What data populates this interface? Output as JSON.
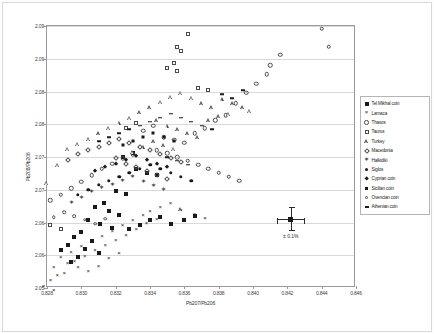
{
  "chart_data": {
    "type": "scatter",
    "title": "",
    "xlabel": "Pb207/Pb206",
    "ylabel": "Pb208/Pb206",
    "xlim": [
      0.828,
      0.846
    ],
    "ylim": [
      2.05,
      2.09
    ],
    "xticks": [
      "0.828",
      "0.830",
      "0.832",
      "0.834",
      "0.836",
      "0.838",
      "0.840",
      "0.842",
      "0.844",
      "0.846"
    ],
    "yticks": [
      "2.05",
      "2.06",
      "2.06",
      "2.07",
      "2.07",
      "2.08",
      "2.08",
      "2.09",
      "2.09"
    ],
    "ytick_values": [
      2.05,
      2.055,
      2.06,
      2.065,
      2.07,
      2.075,
      2.08,
      2.085,
      2.09
    ],
    "grid": "horizontal",
    "legend_position": "right",
    "annotation": {
      "label": "± 0.1%",
      "x": 0.8422,
      "y": 2.0605
    },
    "series": [
      {
        "name": "Tel Mikhal coin",
        "marker": "filled-square",
        "points": [
          [
            0.8332,
            2.0682
          ],
          [
            0.8338,
            2.0676
          ],
          [
            0.8344,
            2.0672
          ],
          [
            0.832,
            2.0648
          ],
          [
            0.8326,
            2.0644
          ],
          [
            0.8313,
            2.063
          ],
          [
            0.8308,
            2.0624
          ],
          [
            0.8316,
            2.0618
          ],
          [
            0.8322,
            2.0612
          ],
          [
            0.8304,
            2.0604
          ],
          [
            0.8311,
            2.0598
          ],
          [
            0.8318,
            2.0592
          ],
          [
            0.83,
            2.0586
          ],
          [
            0.8328,
            2.059
          ],
          [
            0.8334,
            2.0596
          ],
          [
            0.8296,
            2.0578
          ],
          [
            0.8306,
            2.0572
          ],
          [
            0.834,
            2.0604
          ],
          [
            0.8346,
            2.0608
          ],
          [
            0.8352,
            2.0598
          ],
          [
            0.8292,
            2.0566
          ],
          [
            0.8302,
            2.056
          ],
          [
            0.831,
            2.0554
          ],
          [
            0.8298,
            2.0548
          ],
          [
            0.8288,
            2.0558
          ],
          [
            0.8294,
            2.054
          ],
          [
            0.836,
            2.0604
          ],
          [
            0.8366,
            2.061
          ],
          [
            0.8324,
            2.07
          ],
          [
            0.833,
            2.0706
          ]
        ]
      },
      {
        "name": "Larnaca",
        "marker": "x-cross",
        "points": [
          [
            0.8284,
            2.053
          ],
          [
            0.829,
            2.0522
          ],
          [
            0.8296,
            2.054
          ],
          [
            0.8302,
            2.0548
          ],
          [
            0.8308,
            2.0556
          ],
          [
            0.8314,
            2.0564
          ],
          [
            0.832,
            2.0572
          ],
          [
            0.8326,
            2.058
          ],
          [
            0.8332,
            2.0588
          ],
          [
            0.8288,
            2.0546
          ],
          [
            0.8294,
            2.0554
          ],
          [
            0.83,
            2.0562
          ],
          [
            0.8306,
            2.057
          ],
          [
            0.8312,
            2.0578
          ],
          [
            0.8318,
            2.0586
          ],
          [
            0.8324,
            2.0594
          ],
          [
            0.833,
            2.0602
          ],
          [
            0.8336,
            2.061
          ],
          [
            0.8292,
            2.0536
          ],
          [
            0.8298,
            2.053
          ],
          [
            0.8286,
            2.0518
          ],
          [
            0.8282,
            2.051
          ],
          [
            0.8304,
            2.0524
          ],
          [
            0.831,
            2.0532
          ],
          [
            0.8316,
            2.0544
          ],
          [
            0.8322,
            2.0552
          ],
          [
            0.834,
            2.0616
          ],
          [
            0.8346,
            2.0622
          ],
          [
            0.8352,
            2.0628
          ],
          [
            0.8358,
            2.0618
          ],
          [
            0.8366,
            2.0612
          ],
          [
            0.8372,
            2.0606
          ],
          [
            0.8278,
            2.0502
          ],
          [
            0.8284,
            2.0496
          ],
          [
            0.8338,
            2.0598
          ],
          [
            0.8344,
            2.0604
          ]
        ]
      },
      {
        "name": "Thasos",
        "marker": "open-circle",
        "points": [
          [
            0.8336,
            2.074
          ],
          [
            0.8342,
            2.0748
          ],
          [
            0.8348,
            2.073
          ],
          [
            0.8354,
            2.0726
          ],
          [
            0.836,
            2.0722
          ],
          [
            0.8366,
            2.0736
          ],
          [
            0.8372,
            2.0744
          ],
          [
            0.8378,
            2.0756
          ],
          [
            0.8384,
            2.0764
          ],
          [
            0.839,
            2.0782
          ],
          [
            0.8396,
            2.0798
          ],
          [
            0.8402,
            2.0812
          ],
          [
            0.8408,
            2.0826
          ],
          [
            0.844,
            2.0896
          ],
          [
            0.8444,
            2.0868
          ],
          [
            0.833,
            2.0704
          ],
          [
            0.8324,
            2.0698
          ],
          [
            0.8318,
            2.069
          ],
          [
            0.8312,
            2.0682
          ],
          [
            0.8306,
            2.0672
          ],
          [
            0.83,
            2.0662
          ],
          [
            0.8294,
            2.0652
          ],
          [
            0.8344,
            2.071
          ],
          [
            0.835,
            2.0706
          ],
          [
            0.8356,
            2.07
          ],
          [
            0.8362,
            2.0694
          ],
          [
            0.8368,
            2.0688
          ],
          [
            0.8374,
            2.0682
          ],
          [
            0.841,
            2.084
          ],
          [
            0.8416,
            2.0856
          ],
          [
            0.8288,
            2.0642
          ],
          [
            0.8282,
            2.0634
          ],
          [
            0.838,
            2.0676
          ],
          [
            0.8386,
            2.067
          ],
          [
            0.8392,
            2.0664
          ]
        ]
      },
      {
        "name": "Taurus",
        "marker": "open-square",
        "points": [
          [
            0.8362,
            2.0888
          ],
          [
            0.8356,
            2.0868
          ],
          [
            0.8358,
            2.0862
          ],
          [
            0.8354,
            2.0844
          ],
          [
            0.835,
            2.0836
          ],
          [
            0.8356,
            2.0832
          ],
          [
            0.8282,
            2.0596
          ],
          [
            0.8288,
            2.059
          ],
          [
            0.8326,
            2.0744
          ],
          [
            0.8332,
            2.0752
          ],
          [
            0.8368,
            2.0806
          ],
          [
            0.8374,
            2.0802
          ]
        ]
      },
      {
        "name": "Turkey",
        "marker": "open-triangle",
        "points": [
          [
            0.8346,
            2.0784
          ],
          [
            0.8352,
            2.0792
          ],
          [
            0.8358,
            2.0798
          ],
          [
            0.8364,
            2.079
          ],
          [
            0.837,
            2.0782
          ],
          [
            0.8376,
            2.0776
          ],
          [
            0.8382,
            2.0788
          ],
          [
            0.8388,
            2.0782
          ],
          [
            0.8394,
            2.0776
          ],
          [
            0.834,
            2.0776
          ],
          [
            0.8334,
            2.0768
          ],
          [
            0.8328,
            2.076
          ],
          [
            0.8322,
            2.0752
          ],
          [
            0.8316,
            2.0744
          ],
          [
            0.831,
            2.0736
          ],
          [
            0.8304,
            2.0728
          ],
          [
            0.8298,
            2.072
          ],
          [
            0.8292,
            2.0712
          ],
          [
            0.8286,
            2.0688
          ],
          [
            0.828,
            2.066
          ],
          [
            0.8344,
            2.0756
          ],
          [
            0.835,
            2.0748
          ],
          [
            0.8356,
            2.0742
          ],
          [
            0.8362,
            2.0736
          ],
          [
            0.8368,
            2.073
          ],
          [
            0.8374,
            2.0756
          ],
          [
            0.838,
            2.0762
          ],
          [
            0.8386,
            2.0766
          ],
          [
            0.8398,
            2.077
          ],
          [
            0.8342,
            2.0724
          ],
          [
            0.8348,
            2.0718
          ],
          [
            0.8354,
            2.0712
          ],
          [
            0.8336,
            2.0716
          ],
          [
            0.833,
            2.0708
          ],
          [
            0.8358,
            2.062
          ]
        ]
      },
      {
        "name": "Macedonia",
        "marker": "open-diamond",
        "points": [
          [
            0.831,
            2.0716
          ],
          [
            0.8316,
            2.0722
          ],
          [
            0.8322,
            2.0728
          ],
          [
            0.8328,
            2.0722
          ],
          [
            0.8334,
            2.0716
          ],
          [
            0.834,
            2.071
          ],
          [
            0.8346,
            2.0704
          ],
          [
            0.8352,
            2.0698
          ],
          [
            0.8358,
            2.0692
          ],
          [
            0.8304,
            2.071
          ],
          [
            0.8298,
            2.0704
          ],
          [
            0.8292,
            2.0696
          ],
          [
            0.8326,
            2.069
          ],
          [
            0.8332,
            2.0684
          ],
          [
            0.8338,
            2.0678
          ],
          [
            0.8344,
            2.0672
          ],
          [
            0.835,
            2.0666
          ],
          [
            0.832,
            2.0698
          ]
        ]
      },
      {
        "name": "Halkidiki",
        "marker": "star",
        "points": [
          [
            0.8318,
            2.0658
          ],
          [
            0.8324,
            2.0664
          ],
          [
            0.833,
            2.067
          ],
          [
            0.8312,
            2.0652
          ],
          [
            0.8306,
            2.0646
          ],
          [
            0.8336,
            2.0662
          ],
          [
            0.8342,
            2.0656
          ],
          [
            0.83,
            2.0638
          ],
          [
            0.8294,
            2.063
          ],
          [
            0.8348,
            2.065
          ]
        ]
      },
      {
        "name": "Siglos",
        "marker": "filled-circle",
        "points": [
          [
            0.8328,
            2.0676
          ],
          [
            0.8334,
            2.0682
          ],
          [
            0.834,
            2.0688
          ],
          [
            0.8322,
            2.067
          ],
          [
            0.8316,
            2.0664
          ],
          [
            0.8346,
            2.0682
          ],
          [
            0.8352,
            2.0676
          ],
          [
            0.831,
            2.0658
          ],
          [
            0.8304,
            2.065
          ],
          [
            0.8358,
            2.067
          ],
          [
            0.8364,
            2.0664
          ],
          [
            0.8298,
            2.0642
          ]
        ]
      },
      {
        "name": "Cyprian coin",
        "marker": "filled-diamond",
        "points": [
          [
            0.8332,
            2.0702
          ],
          [
            0.8338,
            2.0696
          ],
          [
            0.8344,
            2.069
          ],
          [
            0.8326,
            2.0696
          ],
          [
            0.832,
            2.069
          ],
          [
            0.835,
            2.0684
          ],
          [
            0.8314,
            2.0684
          ],
          [
            0.8308,
            2.0678
          ]
        ]
      },
      {
        "name": "Sicilian coin",
        "marker": "filled-square-small",
        "points": [
          [
            0.8336,
            2.073
          ],
          [
            0.8342,
            2.0736
          ],
          [
            0.833,
            2.0724
          ],
          [
            0.8348,
            2.073
          ],
          [
            0.8354,
            2.0724
          ],
          [
            0.8324,
            2.0718
          ]
        ]
      },
      {
        "name": "Ovencian coin",
        "marker": "open-circle-small",
        "points": [
          [
            0.829,
            2.0616
          ],
          [
            0.8296,
            2.061
          ],
          [
            0.8302,
            2.0604
          ],
          [
            0.8284,
            2.0608
          ],
          [
            0.8308,
            2.0598
          ],
          [
            0.8314,
            2.0606
          ]
        ]
      },
      {
        "name": "Athenian coin",
        "marker": "dash",
        "points": [
          [
            0.834,
            2.0754
          ],
          [
            0.8346,
            2.076
          ],
          [
            0.8352,
            2.0766
          ],
          [
            0.8334,
            2.0748
          ],
          [
            0.8358,
            2.076
          ],
          [
            0.8364,
            2.0754
          ],
          [
            0.837,
            2.0748
          ],
          [
            0.8328,
            2.0742
          ],
          [
            0.8376,
            2.0742
          ],
          [
            0.8382,
            2.0796
          ],
          [
            0.8388,
            2.079
          ],
          [
            0.8322,
            2.0736
          ],
          [
            0.8316,
            2.073
          ],
          [
            0.831,
            2.0724
          ],
          [
            0.8394,
            2.0802
          ],
          [
            0.8356,
            2.0694
          ],
          [
            0.8362,
            2.0688
          ],
          [
            0.835,
            2.07
          ]
        ]
      }
    ]
  }
}
